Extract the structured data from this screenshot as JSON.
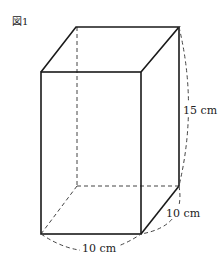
{
  "figure": {
    "label": "図1",
    "shape": "rectangular prism",
    "colors": {
      "line": "#1a1a1a",
      "dashed": "#444444",
      "text": "#222222"
    }
  },
  "dimensions": {
    "height_label": "15 cm",
    "depth_label": "10 cm",
    "width_label": "10 cm"
  },
  "vertices": {
    "front_top_left": [
      41,
      72
    ],
    "front_top_right": [
      141,
      72
    ],
    "back_top_left": [
      76,
      27
    ],
    "back_top_right": [
      179,
      27
    ],
    "front_bottom_left": [
      41,
      234
    ],
    "front_bottom_right": [
      141,
      234
    ],
    "back_bottom_right": [
      179,
      186
    ],
    "back_bottom_left": [
      77,
      186
    ]
  }
}
